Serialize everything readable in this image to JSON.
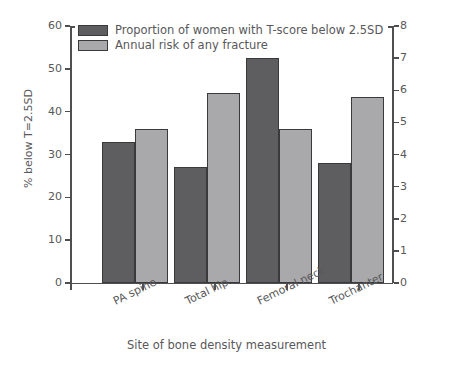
{
  "chart_data": {
    "type": "bar",
    "title": "",
    "categories": [
      "PA spine",
      "Total hip",
      "Femoral neck",
      "Trochanter"
    ],
    "series": [
      {
        "name": "Proportion of women with T-score below 2.5SD",
        "axis": "left",
        "color": "#5e5e60",
        "values": [
          33,
          27,
          52.5,
          28
        ]
      },
      {
        "name": "Annual risk of any fracture",
        "axis": "right",
        "color": "#a9a9ab",
        "values": [
          4.8,
          5.9,
          4.8,
          5.8
        ]
      }
    ],
    "xlabel": "Site of bone density measurement",
    "ylabel_left": "% below T=2.5SD",
    "ylabel_right": "Annual risk of any fracture (%)",
    "ylim_left": [
      0,
      60
    ],
    "ylim_right": [
      0,
      8
    ],
    "yticks_left": [
      "60",
      "50",
      "40",
      "30",
      "20",
      "10",
      "0"
    ],
    "yticks_right": [
      "8",
      "7",
      "6",
      "5",
      "4",
      "3",
      "2",
      "1",
      "0"
    ],
    "grid": false,
    "legend_position": "top-left",
    "legend_entries": [
      "Proportion of women with T-score below 2.5SD",
      "Annual risk of any fracture"
    ]
  }
}
